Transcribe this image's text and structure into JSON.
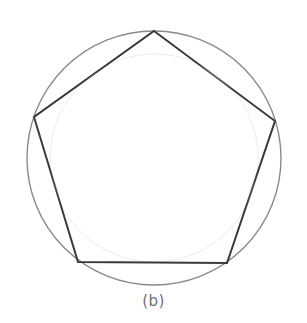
{
  "figure": {
    "caption": "(b)",
    "colors": {
      "circle": "#8a8a8a",
      "inner_circle": "#ededed",
      "pentagon": "#3a3a3a",
      "caption": "#6f6f6f",
      "background": "#ffffff"
    },
    "circle": {
      "cx": 154,
      "cy": 158,
      "r": 127
    },
    "inner_circle": {
      "cx": 154,
      "cy": 158,
      "r": 104
    },
    "pentagon_vertices": [
      {
        "name": "top",
        "x": 154,
        "y": 31
      },
      {
        "name": "right",
        "x": 275,
        "y": 121
      },
      {
        "name": "bottom-right",
        "x": 227,
        "y": 263
      },
      {
        "name": "bottom-left",
        "x": 78,
        "y": 262
      },
      {
        "name": "left",
        "x": 34,
        "y": 117
      }
    ]
  }
}
